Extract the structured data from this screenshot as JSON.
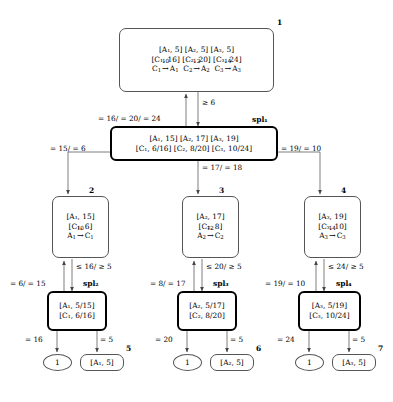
{
  "diagram": {
    "nodes": [
      {
        "id": "n1",
        "label": "1",
        "bold": false,
        "rows": [
          "[A₁, 5]  [A₂, 5]  [A₃, 5]",
          "[C₁, 16]  [C₂, 20]  [C₃, 24]",
          "C₁ →10 A₁  C₂ →12 A₂  C₃ →14 A₃"
        ]
      },
      {
        "id": "n_spl1",
        "label": "spl₁",
        "bold": true,
        "rows": [
          "[A₁, 15]  [A₂, 17]  [A₃, 19]",
          "[C₁, 6/16]  [C₂, 8/20]  [C₃, 10/24]"
        ]
      },
      {
        "id": "n2",
        "label": "2",
        "bold": false,
        "rows": [
          "[A₁, 15]",
          "[C₁, 6]",
          "A₁ →10 C₁"
        ]
      },
      {
        "id": "n3",
        "label": "3",
        "bold": false,
        "rows": [
          "[A₂, 17]",
          "[C₂, 8]",
          "A₂ →12 C₂"
        ]
      },
      {
        "id": "n4",
        "label": "4",
        "bold": false,
        "rows": [
          "[A₃, 19]",
          "[C₃, 10]",
          "A₃ →14 C₃"
        ]
      },
      {
        "id": "n_spl2",
        "label": "spl₂",
        "bold": true,
        "rows": [
          "[A₁, 5/15]",
          "[C₁, 6/16]"
        ]
      },
      {
        "id": "n_spl3",
        "label": "spl₃",
        "bold": true,
        "rows": [
          "[A₂, 5/17]",
          "[C₂, 8/20]"
        ]
      },
      {
        "id": "n_spl4",
        "label": "spl₄",
        "bold": true,
        "rows": [
          "[A₃, 5/19]",
          "[C₃, 10/24]"
        ]
      },
      {
        "id": "n5",
        "label": "5",
        "bold": false,
        "rows": [
          "[A₁, 5]"
        ]
      },
      {
        "id": "n6",
        "label": "6",
        "bold": false,
        "rows": [
          "[A₂, 5]"
        ]
      },
      {
        "id": "n7",
        "label": "7",
        "bold": false,
        "rows": [
          "[A₃, 5]"
        ]
      },
      {
        "id": "e1",
        "label": "",
        "bold": false,
        "rows": [
          "1"
        ]
      },
      {
        "id": "e2",
        "label": "",
        "bold": false,
        "rows": [
          "1"
        ]
      },
      {
        "id": "e3",
        "label": "",
        "bold": false,
        "rows": [
          "1"
        ]
      }
    ],
    "edge_labels": {
      "root_down": "≥ 6",
      "root_up": "= 16/ = 20/ = 24",
      "spl1_left": "= 15/ = 6",
      "spl1_right": "= 19/ = 10",
      "spl1_mid": "= 17/ = 18",
      "n2_down": "≤ 16/ ≥ 5",
      "n2_up": "= 6/ = 15",
      "n3_down": "≤ 20/ ≥ 5",
      "n3_up": "= 8/ = 17",
      "n4_down": "≤ 24/ ≥ 5",
      "n4_up": "= 19/ = 10",
      "spl2_left": "= 16",
      "spl2_right": "= 5",
      "spl3_left": "= 20",
      "spl3_right": "= 5",
      "spl4_left": "= 24",
      "spl4_right": "= 5"
    },
    "node_numbers": {
      "n1": "1",
      "spl1": "spl₁",
      "n2": "2",
      "n3": "3",
      "n4": "4",
      "spl2": "spl₂",
      "spl3": "spl₃",
      "spl4": "spl₄",
      "n5": "5",
      "n6": "6",
      "n7": "7"
    },
    "arrow_costs": {
      "c1a1": "10",
      "c2a2": "12",
      "c3a3": "14"
    },
    "colors": {
      "stroke": "#555555",
      "bold_stroke": "#000000",
      "background": "#ffffff"
    }
  }
}
